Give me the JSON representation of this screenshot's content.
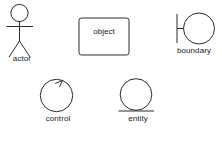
{
  "diagram": {
    "canvas": {
      "width": 222,
      "height": 143
    },
    "stroke_color": "#2b2b2b",
    "text_color": "#1a1a1a",
    "background_color": "#ffffff",
    "elements": [
      {
        "id": "actor",
        "icon": "actor-stick-figure-icon",
        "label": "actor",
        "label_position": "below",
        "description": "Stick figure with circular head, straight body, horizontal arms and two legs"
      },
      {
        "id": "object",
        "icon": "object-rectangle-icon",
        "label": "object",
        "label_position": "inside",
        "description": "Rounded rectangle box with label inside"
      },
      {
        "id": "boundary",
        "icon": "boundary-circle-bar-icon",
        "label": "boundary",
        "label_position": "below",
        "description": "Circle attached by a short connector to a vertical bar on the left"
      },
      {
        "id": "control",
        "icon": "control-circle-arrow-icon",
        "label": "control",
        "label_position": "below",
        "description": "Circle with an arrowhead at the top of its arc"
      },
      {
        "id": "entity",
        "icon": "entity-circle-underline-icon",
        "label": "entity",
        "label_position": "below",
        "description": "Circle resting on a horizontal base line"
      }
    ]
  }
}
